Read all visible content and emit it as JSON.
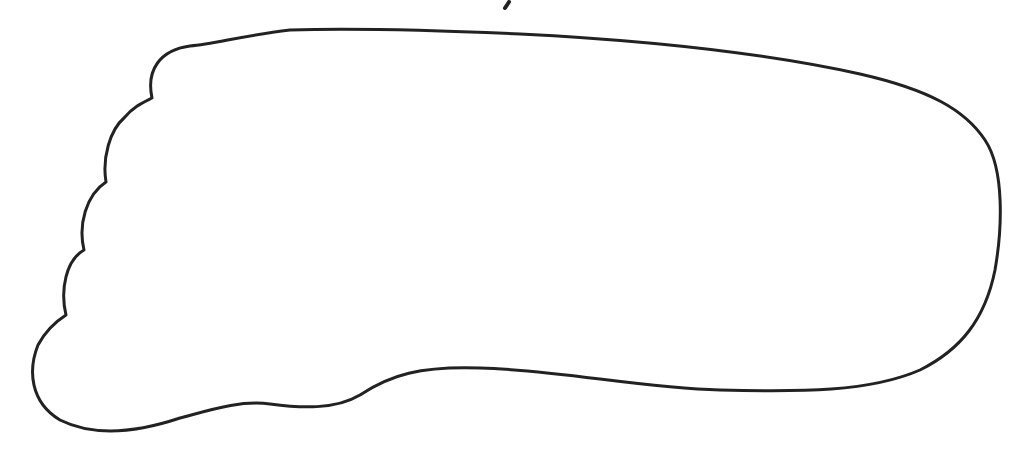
{
  "figure": {
    "stroke_color": "#222222",
    "stroke_width": 3,
    "background": "#ffffff",
    "toe_count": 5
  }
}
